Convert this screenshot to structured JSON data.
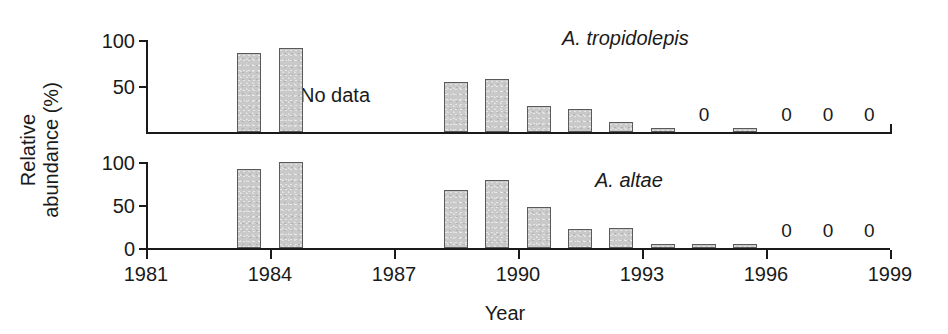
{
  "figure": {
    "width": 948,
    "height": 334,
    "background": "#ffffff",
    "bar_fill": "#c9c9c9",
    "bar_stroke": "#5a5a5a",
    "axis_color": "#1a1a1a"
  },
  "axes": {
    "x_title": "Year",
    "y_title_line1": "Relative",
    "y_title_line2": "abundance (%)",
    "x_ticks": [
      "1981",
      "1984",
      "1987",
      "1990",
      "1993",
      "1996",
      "1999"
    ],
    "x_tick_values": [
      1981,
      1984,
      1987,
      1990,
      1993,
      1996,
      1999
    ],
    "y_ticks_top": [
      "50",
      "100"
    ],
    "y_ticks_bottom": [
      "0",
      "50",
      "100"
    ]
  },
  "panels": {
    "top": {
      "series_label": "A. tropidolepis",
      "note": "No data"
    },
    "bottom": {
      "series_label": "A. altae"
    }
  },
  "chart_data": {
    "type": "bar",
    "title": "",
    "xlabel": "Year",
    "ylabel": "Relative abundance (%)",
    "xlim": [
      1981,
      1999
    ],
    "ylim": [
      0,
      100
    ],
    "grid": false,
    "legend": "none",
    "panels": [
      {
        "name": "A. tropidolepis",
        "annotation": "No data",
        "annotation_years": [
          1985,
          1986,
          1987
        ],
        "yticks": [
          50,
          100
        ],
        "x": [
          1983,
          1984,
          1988,
          1989,
          1990,
          1991,
          1992,
          1993,
          1994,
          1995,
          1996,
          1997,
          1998
        ],
        "values": [
          86,
          91,
          54,
          58,
          28,
          25,
          11,
          3,
          0,
          3,
          0,
          0,
          0
        ],
        "zero_labeled_years": [
          1994,
          1996,
          1997,
          1998
        ]
      },
      {
        "name": "A. altae",
        "yticks": [
          0,
          50,
          100
        ],
        "x": [
          1983,
          1984,
          1988,
          1989,
          1990,
          1991,
          1992,
          1993,
          1994,
          1995,
          1996,
          1997,
          1998
        ],
        "values": [
          92,
          100,
          68,
          79,
          48,
          22,
          23,
          3,
          3,
          3,
          0,
          0,
          0
        ],
        "zero_labeled_years": [
          1996,
          1997,
          1998
        ]
      }
    ]
  }
}
